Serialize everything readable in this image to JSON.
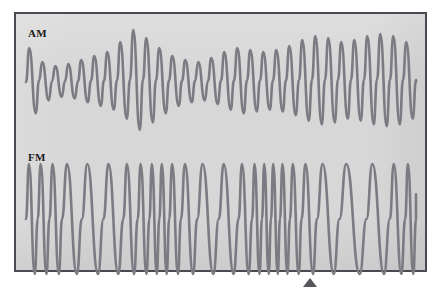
{
  "figure": {
    "background_color": "#ffffff",
    "panel": {
      "background_color": "#d7d7d7",
      "border_color": "#4a4a52",
      "x": 14,
      "y": 12,
      "width": 413,
      "height": 260
    },
    "trace_color": "#7b7b83",
    "label_color": "#1a1a1a",
    "marker": {
      "name": "triangle-marker",
      "shape": "triangle-up",
      "color": "#55555c",
      "x": 310,
      "y": 283
    }
  },
  "labels": {
    "am": "AM",
    "fm": "FM"
  },
  "chart_data": {
    "type": "line",
    "title": "",
    "subtitle": "",
    "xlabel": "",
    "ylabel": "",
    "grid": false,
    "legend_position": "inside-top-left",
    "axis_ranges": {
      "x": [
        0,
        400
      ],
      "y_am": [
        0,
        110
      ],
      "y_fm": [
        0,
        120
      ]
    },
    "series": [
      {
        "name": "AM",
        "label": "AM",
        "modulation": "amplitude",
        "description": "Amplitude-modulated carrier: constant frequency, envelope varies with the modulating signal.",
        "carrier_cycles": 30,
        "carrier_period_px": 13.0,
        "baseline_y": 68,
        "amplitude_min": 12,
        "amplitude_max": 52,
        "envelope": [
          34,
          20,
          16,
          18,
          22,
          26,
          30,
          40,
          52,
          44,
          34,
          26,
          22,
          20,
          24,
          30,
          34,
          32,
          30,
          32,
          36,
          42,
          46,
          44,
          40,
          42,
          46,
          48,
          46,
          40
        ],
        "peak_values": [
          102,
          88,
          84,
          86,
          90,
          94,
          98,
          108,
          120,
          112,
          102,
          94,
          90,
          88,
          92,
          98,
          102,
          100,
          98,
          100,
          104,
          110,
          114,
          112,
          108,
          110,
          114,
          116,
          114,
          108
        ]
      },
      {
        "name": "FM",
        "label": "FM",
        "modulation": "frequency",
        "description": "Frequency-modulated carrier: constant amplitude, instantaneous frequency varies with the modulating signal.",
        "baseline_y": 205,
        "amplitude": 55,
        "amplitude_constant": true,
        "cycle_count": 26,
        "cycle_widths_px": [
          13,
          13,
          14,
          22,
          24,
          22,
          16,
          13,
          11,
          11,
          13,
          18,
          24,
          22,
          15,
          11,
          10,
          10,
          11,
          13,
          17,
          25,
          30,
          26,
          17,
          12
        ],
        "frequency_profile_relative": [
          1.0,
          1.0,
          0.93,
          0.59,
          0.54,
          0.59,
          0.81,
          1.0,
          1.18,
          1.18,
          1.0,
          0.72,
          0.54,
          0.59,
          0.87,
          1.18,
          1.3,
          1.3,
          1.18,
          1.0,
          0.76,
          0.52,
          0.43,
          0.5,
          0.76,
          1.08
        ]
      }
    ]
  }
}
